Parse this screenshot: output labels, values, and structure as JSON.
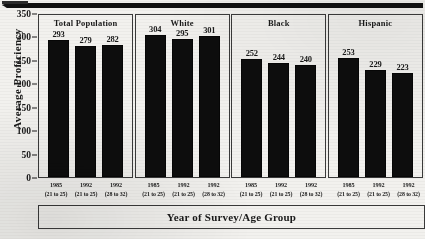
{
  "chart_data": {
    "type": "bar",
    "title": "",
    "xlabel": "Year of Survey/Age Group",
    "ylabel": "Average Proficiency",
    "ylim": [
      0,
      350
    ],
    "yticks": [
      0,
      50,
      100,
      150,
      200,
      250,
      300,
      350
    ],
    "grid": false,
    "legend": "none",
    "bar_color": "#0d0d0d",
    "categories": [
      "1985 (21 to 25)",
      "1992 (21 to 25)",
      "1992 (28 to 32)"
    ],
    "tick_labels": [
      {
        "year": "1985",
        "age": "(21 to 25)"
      },
      {
        "year": "1992",
        "age": "(21 to 25)"
      },
      {
        "year": "1992",
        "age": "(28 to 32)"
      }
    ],
    "panels": [
      {
        "name": "Total Population",
        "values": [
          293,
          279,
          282
        ]
      },
      {
        "name": "White",
        "values": [
          304,
          295,
          301
        ]
      },
      {
        "name": "Black",
        "values": [
          252,
          244,
          240
        ]
      },
      {
        "name": "Hispanic",
        "values": [
          253,
          229,
          223
        ]
      }
    ],
    "series": [
      {
        "name": "Total Population",
        "values": [
          293,
          279,
          282
        ]
      },
      {
        "name": "White",
        "values": [
          304,
          295,
          301
        ]
      },
      {
        "name": "Black",
        "values": [
          252,
          244,
          240
        ]
      },
      {
        "name": "Hispanic",
        "values": [
          253,
          229,
          223
        ]
      }
    ]
  }
}
